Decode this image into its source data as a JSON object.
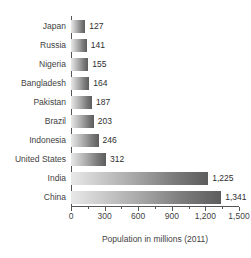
{
  "chart_data": {
    "type": "bar",
    "orientation": "horizontal",
    "title": "",
    "subtitle": "",
    "xlabel": "Population in millions (2011)",
    "ylabel": "",
    "xlim": [
      0,
      1500
    ],
    "grid": false,
    "legend": null,
    "categories": [
      "Japan",
      "Russia",
      "Nigeria",
      "Bangladesh",
      "Pakistan",
      "Brazil",
      "Indonesia",
      "United States",
      "India",
      "China"
    ],
    "values": [
      127,
      141,
      155,
      164,
      187,
      203,
      246,
      312,
      1225,
      1341
    ],
    "value_labels": [
      "127",
      "141",
      "155",
      "164",
      "187",
      "203",
      "246",
      "312",
      "1,225",
      "1,341"
    ],
    "xticks": [
      0,
      300,
      600,
      900,
      1200,
      1500
    ],
    "xtick_labels": [
      "0",
      "300",
      "600",
      "900",
      "1,200",
      "1,500"
    ],
    "xminor_ticks": [
      150,
      450,
      750,
      1050,
      1350
    ],
    "bar_gradient": {
      "from": "#e8e8e8",
      "to": "#5d5d5d",
      "direction": "left-to-right"
    },
    "axis_color": "#555555",
    "text_color": "#3f3f3f",
    "background": "#ffffff"
  }
}
